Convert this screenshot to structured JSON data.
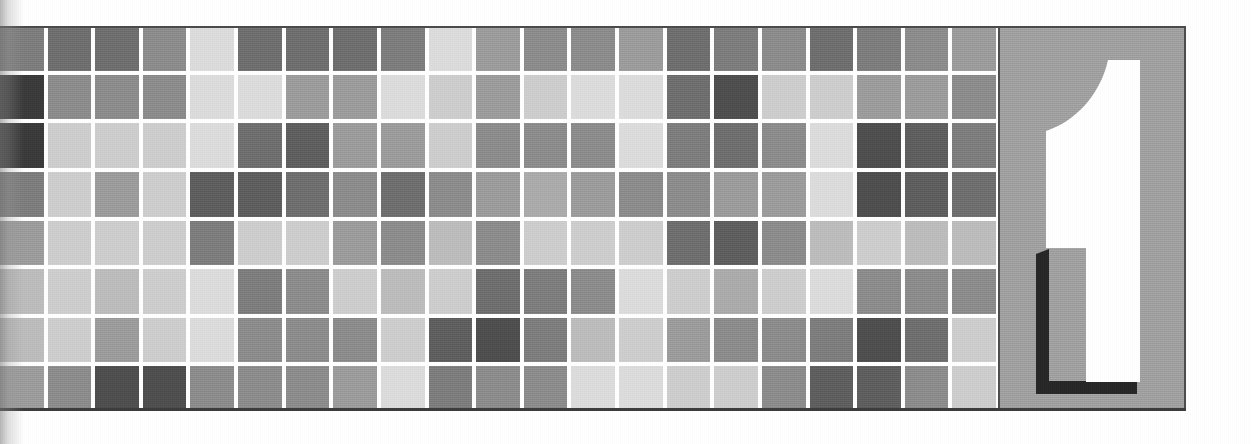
{
  "page": {
    "kind": "chapter-opener",
    "width": 1252,
    "height": 444,
    "background": "#ffffff"
  },
  "numeral_panel": {
    "chapter_number": "1",
    "panel_color": "#a3a3a3",
    "numeral_fill": "#ffffff",
    "numeral_shadow": "#262626",
    "border_color": "#4d4d4d"
  },
  "mosaic": {
    "columns": 21,
    "rows": 8,
    "gap_color": "#ffffff",
    "palette": {
      "g1": "#3a3a3a",
      "g2": "#4e4e4e",
      "g3": "#5e5e5e",
      "g4": "#6e6e6e",
      "g5": "#7d7d7d",
      "g6": "#8c8c8c",
      "g7": "#9c9c9c",
      "g8": "#ababab",
      "g9": "#bcbcbc",
      "g10": "#cdcdcd",
      "g11": "#dcdcdc",
      "g12": "#e9e9e9"
    },
    "cells": [
      [
        "g5",
        "g4",
        "g4",
        "g6",
        "g11",
        "g4",
        "g4",
        "g4",
        "g5",
        "g11",
        "g7",
        "g6",
        "g6",
        "g7",
        "g4",
        "g5",
        "g6",
        "g4",
        "g5",
        "g6",
        "g7"
      ],
      [
        "g1",
        "g6",
        "g6",
        "g6",
        "g11",
        "g11",
        "g7",
        "g7",
        "g11",
        "g10",
        "g7",
        "g10",
        "g11",
        "g11",
        "g4",
        "g2",
        "g10",
        "g10",
        "g7",
        "g7",
        "g6"
      ],
      [
        "g1",
        "g10",
        "g10",
        "g10",
        "g11",
        "g4",
        "g3",
        "g7",
        "g7",
        "g10",
        "g6",
        "g6",
        "g6",
        "g11",
        "g5",
        "g4",
        "g6",
        "g11",
        "g2",
        "g3",
        "g5"
      ],
      [
        "g5",
        "g10",
        "g7",
        "g10",
        "g3",
        "g3",
        "g4",
        "g6",
        "g4",
        "g6",
        "g7",
        "g8",
        "g7",
        "g6",
        "g6",
        "g7",
        "g7",
        "g11",
        "g2",
        "g3",
        "g4"
      ],
      [
        "g7",
        "g10",
        "g10",
        "g10",
        "g5",
        "g10",
        "g10",
        "g7",
        "g6",
        "g9",
        "g6",
        "g10",
        "g10",
        "g10",
        "g4",
        "g3",
        "g6",
        "g9",
        "g10",
        "g9",
        "g9"
      ],
      [
        "g9",
        "g10",
        "g9",
        "g10",
        "g11",
        "g5",
        "g6",
        "g10",
        "g9",
        "g10",
        "g4",
        "g5",
        "g6",
        "g11",
        "g10",
        "g8",
        "g10",
        "g11",
        "g6",
        "g6",
        "g6"
      ],
      [
        "g9",
        "g10",
        "g7",
        "g10",
        "g11",
        "g6",
        "g6",
        "g6",
        "g10",
        "g3",
        "g2",
        "g5",
        "g9",
        "g10",
        "g7",
        "g6",
        "g6",
        "g5",
        "g2",
        "g4",
        "g10"
      ],
      [
        "g7",
        "g6",
        "g2",
        "g2",
        "g6",
        "g6",
        "g6",
        "g7",
        "g11",
        "g5",
        "g6",
        "g6",
        "g11",
        "g11",
        "g10",
        "g10",
        "g6",
        "g3",
        "g3",
        "g6",
        "g10"
      ]
    ]
  }
}
